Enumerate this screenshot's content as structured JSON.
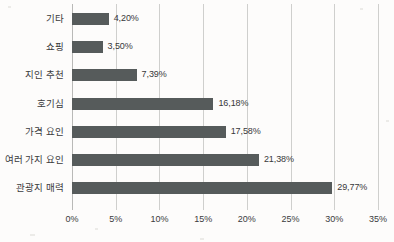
{
  "chart_data": {
    "type": "bar",
    "orientation": "horizontal",
    "title": "",
    "xlabel": "",
    "ylabel": "",
    "xlim": [
      0,
      35
    ],
    "grid": true,
    "legend": false,
    "xticks": [
      "0%",
      "5%",
      "10%",
      "15%",
      "20%",
      "25%",
      "30%",
      "35%"
    ],
    "xtick_values": [
      0,
      5,
      10,
      15,
      20,
      25,
      30,
      35
    ],
    "categories": [
      "기타",
      "쇼핑",
      "지인 추천",
      "호기심",
      "가격 요인",
      "여러 가지 요인",
      "관광지 매력"
    ],
    "values": [
      4.2,
      3.5,
      7.39,
      16.18,
      17.58,
      21.38,
      29.77
    ],
    "value_labels": [
      "4,20%",
      "3,50%",
      "7,39%",
      "16,18%",
      "17,58%",
      "21,38%",
      "29,77%"
    ],
    "bars": [
      {
        "category": "기타",
        "value": 4.2,
        "label": "4,20%"
      },
      {
        "category": "쇼핑",
        "value": 3.5,
        "label": "3,50%"
      },
      {
        "category": "지인 추천",
        "value": 7.39,
        "label": "7,39%"
      },
      {
        "category": "호기심",
        "value": 16.18,
        "label": "16,18%"
      },
      {
        "category": "가격 요인",
        "value": 17.58,
        "label": "17,58%"
      },
      {
        "category": "여러 가지 요인",
        "value": 21.38,
        "label": "21,38%"
      },
      {
        "category": "관광지 매력",
        "value": 29.77,
        "label": "29,77%"
      }
    ],
    "colors": {
      "bar_fill": "#565b5b",
      "gridline": "#cfcfcd",
      "axis": "#b9b9b7",
      "text": "#3b3b3d",
      "background": "#fdfcfb"
    }
  }
}
